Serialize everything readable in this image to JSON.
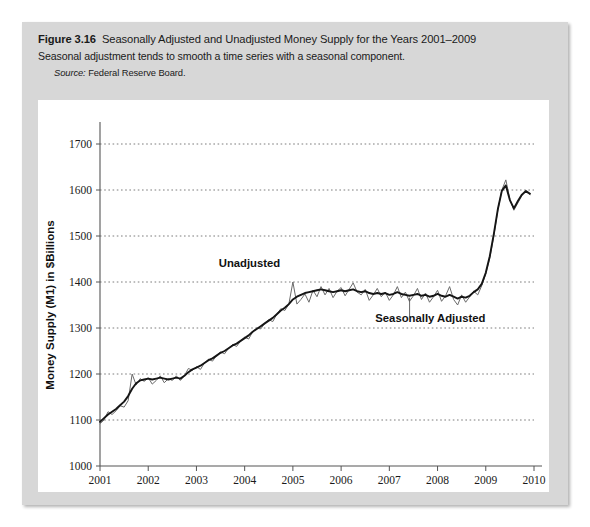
{
  "figure": {
    "number_label": "Figure 3.16",
    "title": "Seasonally Adjusted and Unadjusted Money Supply for the Years 2001–2009",
    "subtitle": "Seasonal adjustment tends to smooth a time series with a seasonal component.",
    "source_label": "Source:",
    "source_text": "Federal Reserve Board."
  },
  "colors": {
    "figure_background": "#d7d7d7",
    "panel_background": "#ffffff",
    "unadjusted_line": "#6a6a6a",
    "adjusted_line": "#151515",
    "gridline": "#6d6d6d",
    "axis": "#555555"
  },
  "chart_data": {
    "type": "line",
    "title": "Seasonally Adjusted and Unadjusted Money Supply for the Years 2001–2009",
    "xlabel": "Year",
    "ylabel": "Money Supply (M1) in $Billions",
    "xlim": [
      2001,
      2010
    ],
    "ylim": [
      1000,
      1700
    ],
    "ytick_labels": [
      "1000",
      "1100",
      "1200",
      "1300",
      "1400",
      "1500",
      "1600",
      "1700"
    ],
    "ytick_values": [
      1000,
      1100,
      1200,
      1300,
      1400,
      1500,
      1600,
      1700
    ],
    "xtick_labels": [
      "2001",
      "2002",
      "2003",
      "2004",
      "2005",
      "2006",
      "2007",
      "2008",
      "2009",
      "2010"
    ],
    "xtick_values": [
      2001,
      2002,
      2003,
      2004,
      2005,
      2006,
      2007,
      2008,
      2009,
      2010
    ],
    "grid": true,
    "grid_axis": "y",
    "legend": "annotations",
    "annotations": [
      {
        "label": "Unadjusted",
        "x": 2004.1,
        "y": 1432,
        "series": "unadjusted"
      },
      {
        "label": "Seasonally Adjusted",
        "x": 2007.85,
        "y": 1312,
        "series": "adjusted"
      }
    ],
    "x_step": 0.08333,
    "series": [
      {
        "name": "Unadjusted",
        "style": "thin-gray",
        "x_start": 2001.0,
        "values": [
          1092,
          1100,
          1118,
          1112,
          1120,
          1131,
          1128,
          1142,
          1200,
          1176,
          1190,
          1184,
          1192,
          1178,
          1186,
          1196,
          1181,
          1190,
          1186,
          1196,
          1186,
          1196,
          1212,
          1208,
          1216,
          1210,
          1224,
          1232,
          1228,
          1240,
          1248,
          1244,
          1256,
          1264,
          1260,
          1272,
          1280,
          1276,
          1292,
          1300,
          1298,
          1310,
          1318,
          1314,
          1330,
          1342,
          1338,
          1352,
          1400,
          1352,
          1362,
          1374,
          1356,
          1382,
          1368,
          1390,
          1372,
          1386,
          1366,
          1380,
          1388,
          1370,
          1384,
          1398,
          1378,
          1372,
          1384,
          1360,
          1372,
          1386,
          1368,
          1378,
          1360,
          1372,
          1390,
          1366,
          1378,
          1358,
          1370,
          1386,
          1362,
          1376,
          1356,
          1368,
          1382,
          1358,
          1370,
          1390,
          1362,
          1350,
          1372,
          1356,
          1368,
          1380,
          1372,
          1392,
          1418,
          1452,
          1500,
          1556,
          1600,
          1622,
          1580,
          1556,
          1572,
          1588,
          1596,
          1590
        ]
      },
      {
        "name": "Seasonally Adjusted",
        "style": "thick-black",
        "x_start": 2001.0,
        "values": [
          1096,
          1104,
          1112,
          1118,
          1124,
          1132,
          1140,
          1152,
          1168,
          1180,
          1186,
          1188,
          1190,
          1188,
          1190,
          1192,
          1190,
          1188,
          1190,
          1192,
          1190,
          1196,
          1204,
          1210,
          1214,
          1218,
          1224,
          1230,
          1234,
          1240,
          1246,
          1250,
          1256,
          1262,
          1266,
          1272,
          1278,
          1284,
          1292,
          1298,
          1304,
          1310,
          1316,
          1322,
          1330,
          1338,
          1344,
          1352,
          1362,
          1368,
          1372,
          1376,
          1378,
          1380,
          1382,
          1384,
          1382,
          1380,
          1378,
          1380,
          1382,
          1380,
          1382,
          1384,
          1380,
          1378,
          1380,
          1376,
          1374,
          1376,
          1374,
          1376,
          1372,
          1374,
          1378,
          1374,
          1372,
          1370,
          1372,
          1374,
          1370,
          1372,
          1368,
          1370,
          1374,
          1370,
          1368,
          1372,
          1368,
          1364,
          1368,
          1366,
          1370,
          1378,
          1384,
          1396,
          1420,
          1456,
          1504,
          1558,
          1598,
          1610,
          1578,
          1560,
          1576,
          1590,
          1598,
          1592
        ]
      }
    ]
  }
}
